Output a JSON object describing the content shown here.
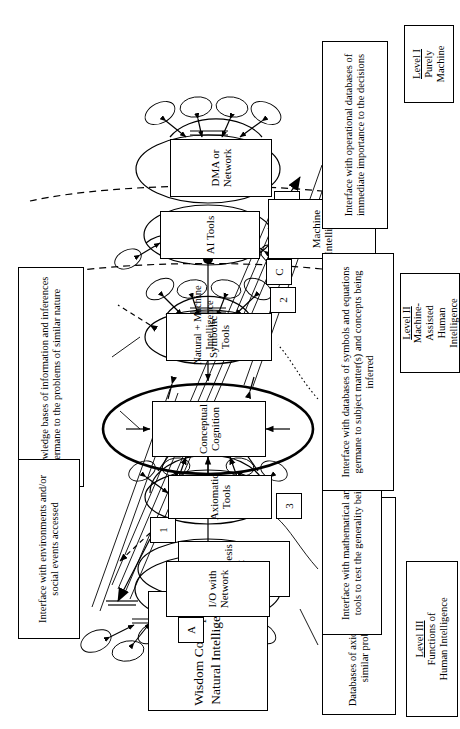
{
  "diagram": {
    "title_line1": "Wisdom Concept (",
    "title_italic": "i",
    "title_line1b": ")",
    "title_line2": "Natural Intelligence",
    "center_label": "Natural  +  Machine Intelligence"
  },
  "nodes": [
    {
      "id": "hypothesis-test",
      "label": "Hypothesis\nTest",
      "marker": "1"
    },
    {
      "id": "axiomatic-tools",
      "label": "Axiomatic\nTools",
      "marker": "3"
    },
    {
      "id": "conceptual-cognition",
      "label": "Conceptual\nCognition",
      "marker": ""
    },
    {
      "id": "symbolic-tools",
      "label": "Symbolic\nTools",
      "marker": "2"
    },
    {
      "id": "io-with-network",
      "label": "I/O with\nNetwork",
      "marker": "A"
    },
    {
      "id": "dma-or-network",
      "label": "DMA or\nNetwork",
      "marker": "B"
    },
    {
      "id": "ai-tools",
      "label": "AI    Tools",
      "marker": "C"
    },
    {
      "id": "machine-intelligence",
      "label": "Machine\nIntelligence",
      "marker": ""
    }
  ],
  "captions": [
    {
      "id": "caption-axioms",
      "text": "Databases of axioms and paradigms germane to similar problems in different subject"
    },
    {
      "id": "caption-math-tools",
      "text": "Interface with mathematical and statistical tools to test the generality being derived"
    },
    {
      "id": "caption-knowledge",
      "text": "Knowledge bases of information and inferences germane to the problems of similar nature"
    },
    {
      "id": "caption-environment",
      "text": "Interface with environments and/or social events  accessed"
    },
    {
      "id": "caption-symbols",
      "text": "Interface with databases of symbols and equations germane to subject matter(s) and concepts being inferred"
    },
    {
      "id": "caption-operational",
      "text": "Interface with operational databases of immediate importance to the decisions"
    }
  ],
  "levels": [
    {
      "id": "level-3",
      "heading": "Level III",
      "body": "Functions of\nHuman Intelligence"
    },
    {
      "id": "level-2",
      "heading": "Level II",
      "body": "Machine-\nAssisted\nHuman\nIntelligence"
    },
    {
      "id": "level-1",
      "heading": "Level I",
      "body": "Purely\nMachine"
    }
  ]
}
